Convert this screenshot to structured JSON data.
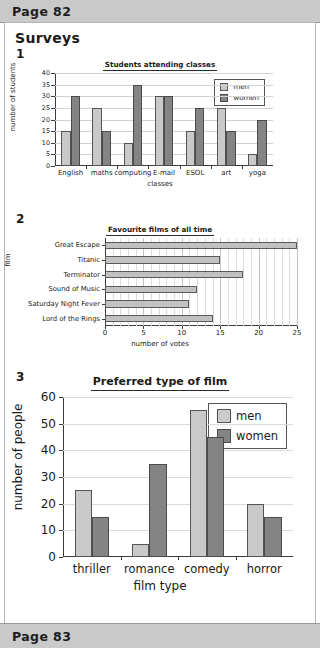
{
  "header": {
    "page_label": "Page 82"
  },
  "footer": {
    "page_label": "Page 83"
  },
  "section": {
    "title": "Surveys"
  },
  "questions": {
    "q1": "1",
    "q2": "2",
    "q3": "3"
  },
  "colors": {
    "men_bar": "#c9c9c9",
    "women_bar": "#848484",
    "single_bar": "#c2c2c2",
    "chrome_bar": "#c9c9c9",
    "axis": "#3a3a3a",
    "grid": "#d2d2d2"
  },
  "chart_data": [
    {
      "type": "bar",
      "title": "Students attending classes",
      "xlabel": "classes",
      "ylabel": "number of students",
      "categories": [
        "English",
        "maths",
        "computing",
        "E-mail",
        "ESOL",
        "art",
        "yoga"
      ],
      "series": [
        {
          "name": "men",
          "values": [
            15,
            25,
            10,
            30,
            15,
            25,
            5
          ]
        },
        {
          "name": "women",
          "values": [
            30,
            15,
            35,
            30,
            25,
            15,
            20
          ]
        }
      ],
      "ylim": [
        0,
        40
      ],
      "yticks": [
        0,
        5,
        10,
        15,
        20,
        25,
        30,
        35,
        40
      ],
      "grid": true,
      "legend_position": "top-right",
      "legend": [
        "men",
        "women"
      ]
    },
    {
      "type": "bar",
      "orientation": "horizontal",
      "title": "Favourite films of all time",
      "xlabel": "number of votes",
      "ylabel": "film",
      "categories": [
        "Great Escape",
        "Titanic",
        "Terminator",
        "Sound of Music",
        "Saturday Night Fever",
        "Lord of the Rings"
      ],
      "values": [
        25,
        15,
        18,
        12,
        11,
        14
      ],
      "xlim": [
        0,
        25
      ],
      "xticks": [
        0,
        5,
        10,
        15,
        20,
        25
      ],
      "minor_tick_step": 1,
      "grid": true,
      "legend_position": "none"
    },
    {
      "type": "bar",
      "title": "Preferred type of film",
      "xlabel": "film type",
      "ylabel": "number of people",
      "categories": [
        "thriller",
        "romance",
        "comedy",
        "horror"
      ],
      "series": [
        {
          "name": "men",
          "values": [
            25,
            5,
            55,
            20
          ]
        },
        {
          "name": "women",
          "values": [
            15,
            35,
            45,
            15
          ]
        }
      ],
      "ylim": [
        0,
        60
      ],
      "yticks": [
        0,
        10,
        20,
        30,
        40,
        50,
        60
      ],
      "grid": true,
      "legend_position": "top-right",
      "legend": [
        "men",
        "women"
      ]
    }
  ]
}
